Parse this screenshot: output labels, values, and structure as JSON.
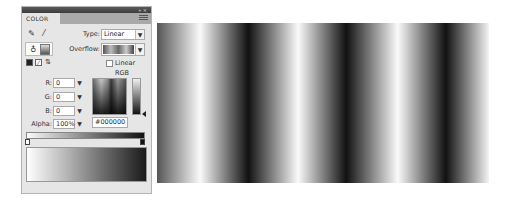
{
  "panel": {
    "title": "COLOR",
    "titlebar_controls": "» ×",
    "tools": {
      "stroke_icon": "pencil-icon",
      "fill_icon": "paint-bucket-icon",
      "swap_icons": [
        "black-white-icon",
        "no-color-icon",
        "swap-colors-icon"
      ]
    },
    "type": {
      "label": "Type:",
      "value": "Linear"
    },
    "overflow": {
      "label": "Overflow:"
    },
    "linear_rgb": {
      "label": "Linear RGB",
      "checked": false
    },
    "channels": [
      {
        "label": "R:",
        "value": "0"
      },
      {
        "label": "G:",
        "value": "0"
      },
      {
        "label": "B:",
        "value": "0"
      }
    ],
    "alpha": {
      "label": "Alpha:",
      "value": "100%"
    },
    "hex": "#000000",
    "gradient": {
      "stops": [
        {
          "position": 0,
          "color": "#ffffff"
        },
        {
          "position": 100,
          "color": "#000000"
        }
      ]
    }
  },
  "stage": {
    "description": "Repeating linear gradient stripes",
    "colors": {
      "light": "#fafafa",
      "dark": "#111111"
    }
  }
}
